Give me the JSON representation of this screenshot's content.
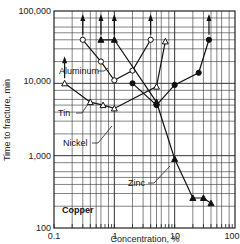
{
  "chart_data": {
    "type": "line",
    "title": "",
    "xlabel": "Concentration, %",
    "ylabel": "Time to fracture, min",
    "xscale": "log",
    "yscale": "log",
    "xlim": [
      0.1,
      100
    ],
    "ylim": [
      100,
      100000
    ],
    "grid": true,
    "x_ticks": [
      "0.1",
      "1",
      "10",
      "100"
    ],
    "y_ticks": [
      "100",
      "1,000",
      "10,000",
      "100,000"
    ],
    "base_label": "Copper",
    "series": [
      {
        "name": "Aluminum",
        "marker": "open-circle",
        "x": [
          0.3,
          0.6,
          1.0,
          2.0,
          4.0
        ],
        "y": [
          40000,
          20000,
          11000,
          15000,
          40000
        ],
        "arrow_up_at": [
          0.3,
          4.0
        ]
      },
      {
        "name": "Tin",
        "marker": "open-triangle",
        "x": [
          0.15,
          0.4,
          0.65,
          1.0,
          5.0,
          7.0
        ],
        "y": [
          10000,
          5500,
          5000,
          4500,
          9000,
          38000
        ],
        "arrow_up_at": [
          0.15
        ]
      },
      {
        "name": "Nickel",
        "marker": "filled-circle",
        "x": [
          2.0,
          5.0,
          10.0,
          25.0,
          37.0
        ],
        "y": [
          10000,
          5000,
          9500,
          14000,
          40000
        ],
        "arrow_up_at": [
          37.0
        ]
      },
      {
        "name": "Zinc",
        "marker": "filled-triangle",
        "x": [
          0.6,
          1.0,
          5.0,
          10.0,
          20.0,
          30.0,
          40.0
        ],
        "y": [
          40000,
          40000,
          5500,
          900,
          260,
          260,
          220
        ],
        "arrow_up_at": [
          0.6,
          1.0
        ]
      }
    ]
  },
  "labels": {
    "aluminum": "Aluminum",
    "tin": "Tin",
    "nickel": "Nickel",
    "zinc": "Zinc",
    "copper": "Copper",
    "xlabel": "Concentration, %",
    "ylabel": "Time to fracture, min",
    "x_ticks": [
      "0.1",
      "1",
      "10",
      "100"
    ],
    "y_ticks": [
      "100",
      "1,000",
      "10,000",
      "100,000"
    ]
  }
}
